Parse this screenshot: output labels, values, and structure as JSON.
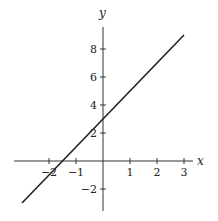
{
  "chart_data": {
    "type": "line",
    "title": "",
    "xlabel": "x",
    "ylabel": "y",
    "xlim": [
      -3,
      3.3
    ],
    "ylim": [
      -3.5,
      9.5
    ],
    "grid": false,
    "x_ticks": [
      -2,
      -1,
      1,
      2,
      3
    ],
    "x_tick_labels": [
      "−2",
      "−1",
      "1",
      "2",
      "3"
    ],
    "y_ticks": [
      -2,
      2,
      4,
      6,
      8
    ],
    "y_tick_labels": [
      "−2",
      "2",
      "4",
      "6",
      "8"
    ],
    "series": [
      {
        "name": "y = 2x + 3",
        "x": [
          -3,
          3
        ],
        "y": [
          -3,
          9
        ]
      }
    ]
  }
}
